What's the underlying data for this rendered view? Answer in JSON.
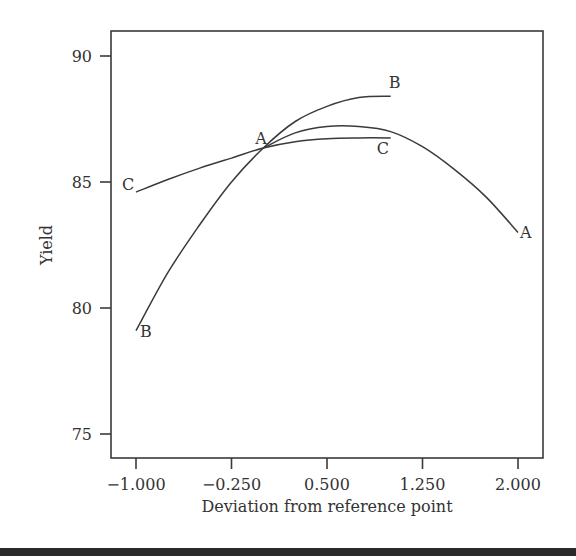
{
  "chart_data": {
    "type": "line",
    "title": "",
    "xlabel": "Deviation from reference point",
    "ylabel": "Yield",
    "xlim": [
      -1.2,
      2.3
    ],
    "ylim": [
      74.0,
      91.0
    ],
    "xticks": [
      -1.0,
      -0.25,
      0.5,
      1.25,
      2.0
    ],
    "xtick_labels": [
      "−1.000",
      "−0.250",
      "0.500",
      "1.250",
      "2.000"
    ],
    "yticks": [
      75,
      80,
      85,
      90
    ],
    "ytick_labels": [
      "75",
      "80",
      "85",
      "90"
    ],
    "grid": false,
    "legend": "none (curves labeled inline)",
    "series": [
      {
        "name": "A",
        "x": [
          0.0,
          0.25,
          0.5,
          0.75,
          1.0,
          1.25,
          1.5,
          1.75,
          2.0
        ],
        "y": [
          86.35,
          86.95,
          87.2,
          87.2,
          87.0,
          86.4,
          85.5,
          84.4,
          83.0
        ],
        "labels": [
          {
            "text": "A",
            "x": 0.0,
            "y": 86.35,
            "pos": "start"
          },
          {
            "text": "A",
            "x": 2.0,
            "y": 83.0,
            "pos": "end"
          }
        ]
      },
      {
        "name": "B",
        "x": [
          -1.0,
          -0.75,
          -0.5,
          -0.25,
          0.0,
          0.25,
          0.5,
          0.75,
          1.0
        ],
        "y": [
          79.1,
          81.4,
          83.3,
          85.0,
          86.35,
          87.4,
          88.0,
          88.35,
          88.4
        ],
        "labels": [
          {
            "text": "B",
            "x": -1.0,
            "y": 79.1,
            "pos": "start"
          },
          {
            "text": "B",
            "x": 1.0,
            "y": 88.4,
            "pos": "end"
          }
        ]
      },
      {
        "name": "C",
        "x": [
          -1.0,
          -0.75,
          -0.5,
          -0.25,
          0.0,
          0.25,
          0.5,
          0.75,
          1.0
        ],
        "y": [
          84.6,
          85.1,
          85.55,
          85.95,
          86.35,
          86.6,
          86.72,
          86.75,
          86.75
        ],
        "labels": [
          {
            "text": "C",
            "x": -1.0,
            "y": 84.6,
            "pos": "start"
          },
          {
            "text": "C",
            "x": 1.0,
            "y": 86.75,
            "pos": "end"
          }
        ]
      }
    ]
  },
  "axes": {
    "x_title": "Deviation from reference point",
    "y_title": "Yield"
  }
}
